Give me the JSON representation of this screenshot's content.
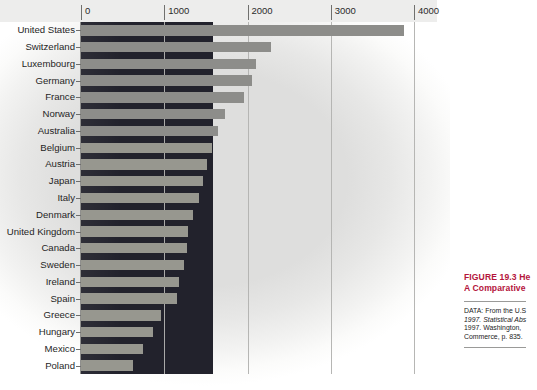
{
  "figure": {
    "title_line1": "FIGURE 19.3  He",
    "title_line2": "A Comparative",
    "source_lines": [
      "DATA: From the U.S",
      "1997. Statistical Abs",
      "1997. Washington,",
      "Commerce, p. 835."
    ]
  },
  "chart_data": {
    "type": "bar",
    "orientation": "horizontal",
    "xlabel": "",
    "ylabel": "",
    "xlim": [
      0,
      4000
    ],
    "xticks": [
      0,
      1000,
      2000,
      3000,
      4000
    ],
    "xtick_labels": [
      "0",
      "1000",
      "2000",
      "3000",
      "4000"
    ],
    "grid": true,
    "legend": "none",
    "bar_color": "#8d8d8a",
    "panel_color": "#22222c",
    "panel_extent": 1580,
    "categories": [
      "United States",
      "Switzerland",
      "Luxembourg",
      "Germany",
      "France",
      "Norway",
      "Australia",
      "Belgium",
      "Austria",
      "Japan",
      "Italy",
      "Denmark",
      "United Kingdom",
      "Canada",
      "Sweden",
      "Ireland",
      "Spain",
      "Greece",
      "Hungary",
      "Mexico",
      "Poland"
    ],
    "values": [
      3880,
      2280,
      2100,
      2050,
      1960,
      1730,
      1640,
      1570,
      1510,
      1460,
      1420,
      1350,
      1290,
      1270,
      1240,
      1180,
      1150,
      960,
      870,
      750,
      620
    ]
  }
}
